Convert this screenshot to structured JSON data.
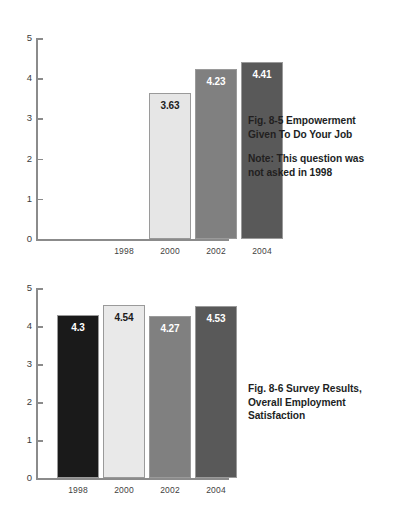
{
  "page": {
    "background": "#ffffff",
    "width": 412,
    "height": 511
  },
  "figures": [
    {
      "id": "fig-8-5",
      "caption_title": "Fig. 8-5  Empowerment",
      "caption_title_line2": "Given To Do Your Job",
      "caption_note": "Note: This question was",
      "caption_note_line2": "not asked in 1998",
      "chart_data": {
        "type": "bar",
        "title": "Fig. 8-5  Empowerment Given To Do Your Job",
        "annotations": [
          "Note: This question was not asked in 1998"
        ],
        "xlabel": "",
        "ylabel": "",
        "ylim": [
          0,
          5
        ],
        "yticks": [
          "0",
          "1",
          "2",
          "3",
          "4",
          "5"
        ],
        "grid": false,
        "legend": "none",
        "categories": [
          "1998",
          "2000",
          "2002",
          "2004"
        ],
        "values": [
          null,
          3.63,
          4.23,
          4.41
        ],
        "labels": [
          "",
          "3.63",
          "4.23",
          "4.41"
        ],
        "colors": [
          "#ffffff",
          "#e6e6e6",
          "#808080",
          "#595959"
        ],
        "label_colors": [
          "",
          "#1b1b1b",
          "#ffffff",
          "#ffffff"
        ]
      }
    },
    {
      "id": "fig-8-6",
      "caption_title": "Fig. 8-6  Survey Results,",
      "caption_title_line2": "Overall Employment",
      "caption_title_line3": "Satisfaction",
      "chart_data": {
        "type": "bar",
        "title": "Fig. 8-6  Survey Results, Overall Employment Satisfaction",
        "xlabel": "",
        "ylabel": "",
        "ylim": [
          0,
          5
        ],
        "yticks": [
          "0",
          "1",
          "2",
          "3",
          "4",
          "5"
        ],
        "grid": false,
        "legend": "none",
        "categories": [
          "1998",
          "2000",
          "2002",
          "2004"
        ],
        "values": [
          4.3,
          4.54,
          4.27,
          4.53
        ],
        "labels": [
          "4.3",
          "4.54",
          "4.27",
          "4.53"
        ],
        "colors": [
          "#1a1a1a",
          "#e9e9e9",
          "#808080",
          "#595959"
        ],
        "label_colors": [
          "#ffffff",
          "#1b1b1b",
          "#ffffff",
          "#ffffff"
        ]
      }
    }
  ]
}
